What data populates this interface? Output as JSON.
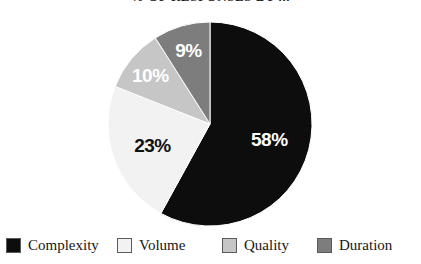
{
  "chart_data": {
    "type": "pie",
    "title": "% OF RESPONSES BY ...",
    "xlabel": "",
    "ylabel": "",
    "legend_position": "bottom",
    "grid": false,
    "total": 100,
    "unit": "%",
    "categories": [
      "Complexity",
      "Volume",
      "Quality",
      "Duration"
    ],
    "values": [
      58,
      23,
      10,
      9
    ],
    "colors": [
      "#0d0d0d",
      "#f2f2f2",
      "#c6c6c6",
      "#7d7d7d"
    ],
    "slices": [
      {
        "label": "Complexity",
        "value": 58,
        "display": "58%",
        "color": "#0d0d0d",
        "label_color": "#ffffff",
        "start_angle": 0,
        "end_angle": 208.8
      },
      {
        "label": "Volume",
        "value": 23,
        "display": "23%",
        "color": "#f2f2f2",
        "label_color": "#111111",
        "start_angle": 208.8,
        "end_angle": 291.6
      },
      {
        "label": "Quality",
        "value": 10,
        "display": "10%",
        "color": "#c6c6c6",
        "label_color": "#ffffff",
        "start_angle": 291.6,
        "end_angle": 327.6
      },
      {
        "label": "Duration",
        "value": 9,
        "display": "9%",
        "color": "#7d7d7d",
        "label_color": "#ffffff",
        "start_angle": 327.6,
        "end_angle": 360
      }
    ]
  },
  "legend": {
    "items": [
      {
        "label": "Complexity",
        "color": "#0d0d0d"
      },
      {
        "label": "Volume",
        "color": "#f2f2f2"
      },
      {
        "label": "Quality",
        "color": "#c6c6c6"
      },
      {
        "label": "Duration",
        "color": "#7d7d7d"
      }
    ]
  }
}
